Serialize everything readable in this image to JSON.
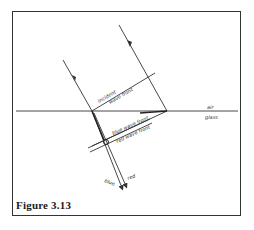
{
  "figure": {
    "caption": "Figure 3.13"
  },
  "labels": {
    "incident_wavefront_line1": "incident",
    "incident_wavefront_line2": "wave front",
    "medium_top": "air",
    "medium_bottom": "glass",
    "blue_wavefront": "blue wave front",
    "red_wavefront": "red wave front",
    "ray_blue": "blue",
    "ray_red": "red"
  },
  "colors": {
    "line": "#333333",
    "background": "#ffffff"
  }
}
